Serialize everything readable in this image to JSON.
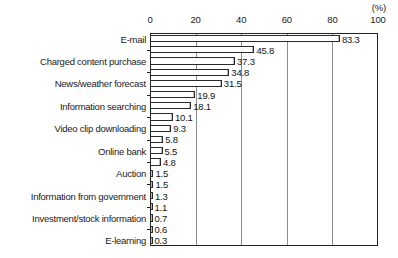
{
  "chart_data": {
    "type": "bar",
    "orientation": "horizontal",
    "title": "",
    "xlabel": "",
    "ylabel": "",
    "unit_label": "(%)",
    "xlim": [
      0,
      100
    ],
    "xticks": [
      0,
      20,
      40,
      60,
      80,
      100
    ],
    "xtick_labels": [
      "0",
      "20",
      "40",
      "60",
      "80",
      "100"
    ],
    "grid": true,
    "grid_axis": "x",
    "legend": false,
    "categories": [
      "E-mail",
      "",
      "Charged content purchase",
      "",
      "News/weather forecast",
      "",
      "Information searching",
      "",
      "Video clip downloading",
      "",
      "Online bank",
      "",
      "Auction",
      "",
      "Information from government",
      "",
      "Investment/stock information",
      "",
      "E-learning"
    ],
    "values": [
      83.3,
      45.8,
      37.3,
      34.8,
      31.5,
      19.9,
      18.1,
      10.1,
      9.3,
      5.8,
      5.5,
      4.8,
      1.5,
      1.5,
      1.3,
      1.1,
      0.7,
      0.6,
      0.3
    ],
    "value_labels": [
      "83.3",
      "45.8",
      "37.3",
      "34.8",
      "31.5",
      "19.9",
      "18.1",
      "10.1",
      "9.3",
      "5.8",
      "5.5",
      "4.8",
      "1.5",
      "1.5",
      "1.3",
      "1.1",
      "0.7",
      "0.6",
      "0.3"
    ],
    "bar_face_color": "#ffffff",
    "bar_edge_color": "#2a2a2a",
    "grid_color": "#8c8c8c",
    "axis_color": "#222222",
    "background_color": "#ffffff"
  }
}
